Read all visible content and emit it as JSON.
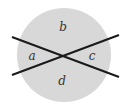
{
  "diagram": {
    "type": "circle-with-intersecting-lines",
    "circle": {
      "cx": 64,
      "cy": 55,
      "r": 47,
      "fill": "#d8d8d8"
    },
    "lines": [
      {
        "x1": 12,
        "y1": 37,
        "x2": 119,
        "y2": 77,
        "color": "#1a1a1a"
      },
      {
        "x1": 12,
        "y1": 75,
        "x2": 119,
        "y2": 35,
        "color": "#1a1a1a"
      }
    ],
    "labels": {
      "a": "a",
      "b": "b",
      "c": "c",
      "d": "d"
    }
  }
}
